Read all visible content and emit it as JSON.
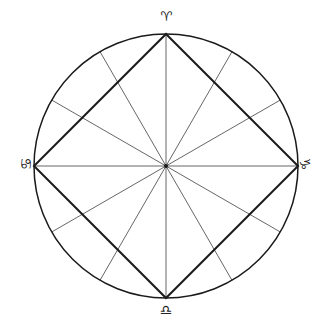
{
  "diagram": {
    "type": "astrological-chart-wheel",
    "center": [
      166,
      166
    ],
    "radius": 132,
    "spoke_count": 12,
    "spoke_angle_step_deg": 30,
    "square_vertices": [
      "top",
      "right",
      "bottom",
      "left"
    ],
    "colors": {
      "stroke": "#1a1a1a",
      "spoke": "#555555",
      "background": "#ffffff"
    }
  },
  "signs": {
    "top": {
      "name": "Aries",
      "glyph": "♈"
    },
    "left": {
      "name": "Cancer",
      "glyph": "♋"
    },
    "right": {
      "name": "Capricorn",
      "glyph": "♑"
    },
    "bottom": {
      "name": "Libra",
      "glyph": "♎"
    }
  }
}
